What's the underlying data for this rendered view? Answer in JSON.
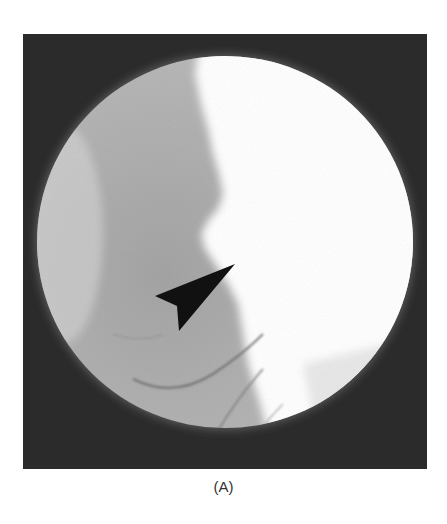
{
  "figure": {
    "panel_label": "(A)",
    "annotation": {
      "type": "arrowhead",
      "direction": "upper-right",
      "color": "#111111"
    },
    "colors": {
      "background": "#2b2b2b",
      "field_grey": "#a8a8a8",
      "field_bright": "#ffffff",
      "arrow": "#111111"
    }
  }
}
